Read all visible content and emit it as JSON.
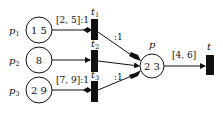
{
  "diagram": {
    "type": "petri-net",
    "places": [
      {
        "id": "p1",
        "name": "p",
        "sub": "1",
        "tokens": "1 5"
      },
      {
        "id": "p2",
        "name": "p",
        "sub": "2",
        "tokens": "8"
      },
      {
        "id": "p3",
        "name": "p",
        "sub": "3",
        "tokens": "2 9"
      },
      {
        "id": "p",
        "name": "p",
        "sub": "",
        "tokens": "2 3"
      }
    ],
    "transitions": [
      {
        "id": "t1",
        "name": "t",
        "sub": "1"
      },
      {
        "id": "t2",
        "name": "t",
        "sub": "2"
      },
      {
        "id": "t3",
        "name": "t",
        "sub": "3"
      },
      {
        "id": "t",
        "name": "t",
        "sub": ""
      }
    ],
    "arcs": [
      {
        "from": "p1",
        "to": "t1",
        "label": "[2, 5]:1",
        "type": "inhibitor-diamond"
      },
      {
        "from": "p2",
        "to": "t2",
        "label": "",
        "type": "normal"
      },
      {
        "from": "p3",
        "to": "t3",
        "label": "[7, 9]:1",
        "type": "inhibitor-diamond"
      },
      {
        "from": "t1",
        "to": "p",
        "label": ":1",
        "type": "tagged"
      },
      {
        "from": "t2",
        "to": "p",
        "label": "",
        "type": "normal"
      },
      {
        "from": "t3",
        "to": "p",
        "label": ":1",
        "type": "tagged"
      },
      {
        "from": "p",
        "to": "t",
        "label": "[4, 6]",
        "type": "normal"
      }
    ]
  }
}
